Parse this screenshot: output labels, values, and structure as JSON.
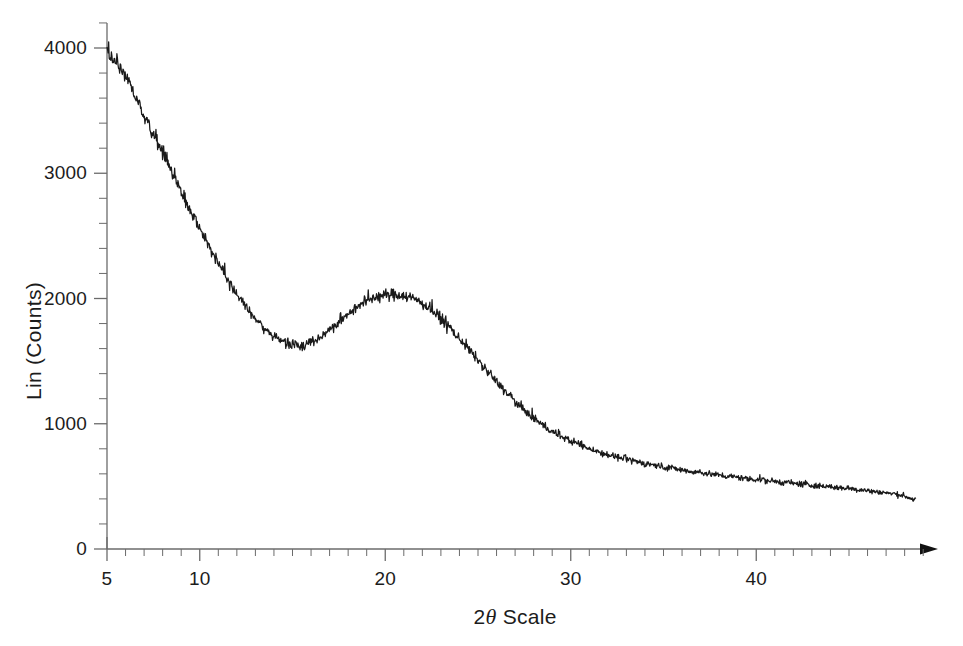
{
  "chart_data": {
    "type": "line",
    "title": "",
    "subtitle": "",
    "xlabel_prefix": "2",
    "xlabel_symbol": "θ",
    "xlabel_suffix": " Scale",
    "xlabel": "2θ Scale",
    "ylabel": "Lin (Counts)",
    "xlim": [
      5,
      49
    ],
    "ylim": [
      0,
      4200
    ],
    "xticks": [
      5,
      6,
      7,
      8,
      9,
      10,
      11,
      12,
      13,
      14,
      15,
      16,
      17,
      18,
      19,
      20,
      21,
      22,
      23,
      24,
      25,
      26,
      27,
      28,
      29,
      30,
      31,
      32,
      33,
      34,
      35,
      36,
      37,
      38,
      39,
      40,
      41,
      42,
      43,
      44,
      45,
      46,
      47,
      48,
      49
    ],
    "xtick_labels": [
      {
        "value": 5,
        "label": "5"
      },
      {
        "value": 10,
        "label": "10"
      },
      {
        "value": 20,
        "label": "20"
      },
      {
        "value": 30,
        "label": "30"
      },
      {
        "value": 40,
        "label": "40"
      }
    ],
    "ytick_labels": [
      {
        "value": 0,
        "label": "0"
      },
      {
        "value": 1000,
        "label": "1000"
      },
      {
        "value": 2000,
        "label": "2000"
      },
      {
        "value": 3000,
        "label": "3000"
      },
      {
        "value": 4000,
        "label": "4000"
      }
    ],
    "y_minor_step": 200,
    "y_major_step": 1000,
    "x_minor_step": 1,
    "grid": false,
    "legend": "none",
    "axis_color": "#6b6b6b",
    "trace_color": "#1a1a1a",
    "background_color": "#ffffff",
    "x_axis_arrow": true,
    "noise_amplitude": 45,
    "series": [
      {
        "name": "XRD intensity",
        "x": [
          5.0,
          5.5,
          6.0,
          6.5,
          7.0,
          7.5,
          8.0,
          8.5,
          9.0,
          9.5,
          10.0,
          10.5,
          11.0,
          11.5,
          12.0,
          12.5,
          13.0,
          13.5,
          14.0,
          14.5,
          15.0,
          15.5,
          16.0,
          16.5,
          17.0,
          17.5,
          18.0,
          18.5,
          19.0,
          19.5,
          20.0,
          20.5,
          21.0,
          21.5,
          22.0,
          22.5,
          23.0,
          23.5,
          24.0,
          24.5,
          25.0,
          25.5,
          26.0,
          26.5,
          27.0,
          27.5,
          28.0,
          28.5,
          29.0,
          29.5,
          30.0,
          31.0,
          32.0,
          33.0,
          34.0,
          35.0,
          36.0,
          37.0,
          38.0,
          39.0,
          40.0,
          41.0,
          42.0,
          43.0,
          44.0,
          45.0,
          46.0,
          47.0,
          48.0,
          48.6
        ],
        "y": [
          3985,
          3880,
          3760,
          3620,
          3470,
          3320,
          3170,
          3010,
          2850,
          2700,
          2560,
          2420,
          2290,
          2160,
          2040,
          1930,
          1840,
          1760,
          1700,
          1660,
          1638,
          1632,
          1650,
          1690,
          1745,
          1810,
          1880,
          1940,
          1985,
          2010,
          2025,
          2032,
          2025,
          2000,
          1960,
          1905,
          1840,
          1765,
          1680,
          1595,
          1505,
          1420,
          1335,
          1255,
          1180,
          1110,
          1045,
          990,
          940,
          898,
          862,
          802,
          755,
          716,
          684,
          656,
          632,
          610,
          590,
          572,
          556,
          540,
          524,
          510,
          496,
          482,
          466,
          448,
          424,
          390
        ]
      }
    ]
  },
  "axis_geometry": {
    "plot_left_px": 107,
    "plot_baseline_px": 549,
    "plot_top_px": 40,
    "plot_right_px": 938,
    "px_per_degree": 18.55,
    "px_per_1000_counts": 125.25
  }
}
